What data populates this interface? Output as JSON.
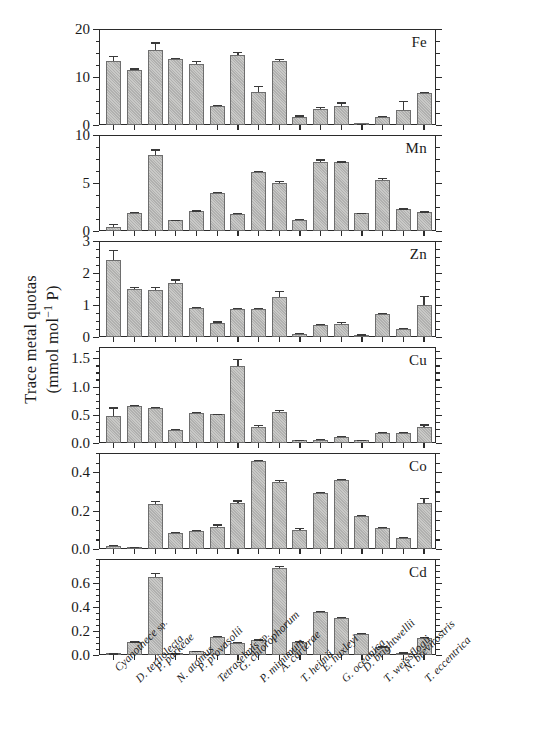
{
  "figure": {
    "ylabel_line1": "Trace metal quotas",
    "ylabel_line2_pre": "(mmol mol",
    "ylabel_line2_sup": "−1",
    "ylabel_line2_post": " P)"
  },
  "chart_data": {
    "type": "bar",
    "title": "",
    "xlabel": "",
    "ylabel": "Trace metal quotas (mmol mol−1 P)",
    "grid": false,
    "legend": "none",
    "orientation": "vertical",
    "error_bars": "standard deviation",
    "categories": [
      "Cyanothece sp.",
      "D. tertiolecta",
      "P. parkeae",
      "N. atomus",
      "P. provasolii",
      "Tetraselmis sp.",
      "G. chlorophorum",
      "P. mimimum",
      "A. carterae",
      "T. heimii",
      "E. huxleyi",
      "G. oceanica",
      "D. brightwellii",
      "T. weissflogii",
      "N. brevirostris",
      "T. eccentrica"
    ],
    "category_italic_suffix": {
      "0": "sp.",
      "5": "sp."
    },
    "panels": [
      {
        "element": "Fe",
        "ylim": [
          0,
          20
        ],
        "yticks": [
          0,
          10,
          20
        ],
        "ytick_labels": [
          "0",
          "10",
          "20"
        ],
        "minor_tick_step": 2.5,
        "values": [
          13.3,
          11.4,
          15.6,
          13.7,
          12.7,
          3.9,
          14.5,
          6.9,
          13.4,
          1.7,
          3.4,
          4.0,
          0.2,
          1.7,
          3.2,
          6.7
        ],
        "errors": [
          1.1,
          0.4,
          1.6,
          0.3,
          0.6,
          0.3,
          0.7,
          1.3,
          0.3,
          0.3,
          0.3,
          0.7,
          0.05,
          0.2,
          1.8,
          0.2
        ]
      },
      {
        "element": "Mn",
        "ylim": [
          0,
          10
        ],
        "yticks": [
          0,
          5,
          10
        ],
        "ytick_labels": [
          "0",
          "5",
          "10"
        ],
        "minor_tick_step": 1.25,
        "values": [
          0.45,
          1.85,
          7.9,
          1.1,
          2.05,
          3.95,
          1.8,
          6.15,
          5.05,
          1.15,
          7.2,
          7.15,
          1.85,
          5.35,
          2.25,
          1.95
        ],
        "errors": [
          0.25,
          0.1,
          0.6,
          0.07,
          0.1,
          0.15,
          0.1,
          0.1,
          0.15,
          0.07,
          0.25,
          0.1,
          0.07,
          0.15,
          0.1,
          0.1
        ]
      },
      {
        "element": "Zn",
        "ylim": [
          0,
          3
        ],
        "yticks": [
          0,
          1,
          2,
          3
        ],
        "ytick_labels": [
          "0",
          "1",
          "2",
          "3"
        ],
        "minor_tick_step": 0.25,
        "values": [
          2.4,
          1.5,
          1.48,
          1.7,
          0.9,
          0.44,
          0.86,
          0.87,
          1.26,
          0.1,
          0.36,
          0.4,
          0.06,
          0.73,
          0.25,
          1.0
        ],
        "errors": [
          0.32,
          0.06,
          0.08,
          0.1,
          0.04,
          0.05,
          0.05,
          0.04,
          0.17,
          0.03,
          0.04,
          0.07,
          0.02,
          0.02,
          0.03,
          0.29
        ]
      },
      {
        "element": "Cu",
        "ylim": [
          0,
          1.7
        ],
        "yticks": [
          0.0,
          0.5,
          1.0,
          1.5
        ],
        "ytick_labels": [
          "0.0",
          "0.5",
          "1.0",
          "1.5"
        ],
        "minor_tick_step": 0.125,
        "values": [
          0.47,
          0.655,
          0.62,
          0.235,
          0.525,
          0.505,
          1.36,
          0.285,
          0.545,
          0.05,
          0.06,
          0.105,
          0.05,
          0.175,
          0.18,
          0.285
        ],
        "errors": [
          0.16,
          0.02,
          0.02,
          0.015,
          0.025,
          0.015,
          0.13,
          0.035,
          0.035,
          0.01,
          0.015,
          0.015,
          0.01,
          0.015,
          0.015,
          0.045
        ]
      },
      {
        "element": "Co",
        "ylim": [
          0,
          0.5
        ],
        "yticks": [
          0.0,
          0.2,
          0.4
        ],
        "ytick_labels": [
          "0.0",
          "0.2",
          "0.4"
        ],
        "minor_tick_step": 0.05,
        "values": [
          0.018,
          0.008,
          0.235,
          0.082,
          0.092,
          0.117,
          0.242,
          0.457,
          0.351,
          0.098,
          0.291,
          0.358,
          0.173,
          0.111,
          0.057,
          0.239
        ],
        "errors": [
          0.004,
          0.003,
          0.015,
          0.005,
          0.006,
          0.011,
          0.011,
          0.008,
          0.007,
          0.01,
          0.008,
          0.008,
          0.005,
          0.005,
          0.004,
          0.028
        ]
      },
      {
        "element": "Cd",
        "ylim": [
          0,
          0.8
        ],
        "yticks": [
          0.0,
          0.2,
          0.4,
          0.6
        ],
        "ytick_labels": [
          "0.0",
          "0.2",
          "0.4",
          "0.6"
        ],
        "minor_tick_step": 0.05,
        "values": [
          0.01,
          0.105,
          0.648,
          0.01,
          0.03,
          0.152,
          0.098,
          0.122,
          0.722,
          0.11,
          0.358,
          0.308,
          0.175,
          0.065,
          0.018,
          0.143
        ],
        "errors": [
          0.004,
          0.008,
          0.038,
          0.004,
          0.006,
          0.01,
          0.008,
          0.008,
          0.022,
          0.006,
          0.01,
          0.01,
          0.01,
          0.006,
          0.004,
          0.01
        ]
      }
    ]
  }
}
